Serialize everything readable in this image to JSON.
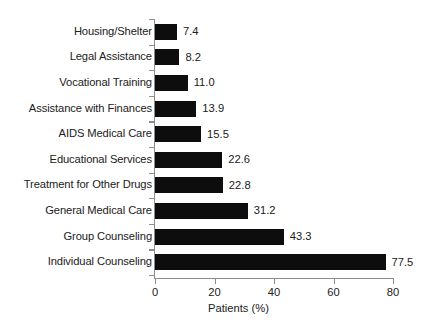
{
  "chart_data": {
    "type": "bar",
    "orientation": "horizontal",
    "title": "",
    "xlabel": "Patients (%)",
    "ylabel": "",
    "xlim": [
      0,
      80
    ],
    "xticks": [
      "0",
      "20",
      "40",
      "60",
      "80"
    ],
    "grid": false,
    "legend": null,
    "bar_color": "#0d0d0d",
    "axis_color": "#8c8c8c",
    "text_color": "#212121",
    "background": "#ffffff",
    "categories": [
      "Housing/Shelter",
      "Legal Assistance",
      "Vocational Training",
      "Assistance with Finances",
      "AIDS Medical Care",
      "Educational Services",
      "Treatment for Other Drugs",
      "General Medical Care",
      "Group Counseling",
      "Individual Counseling"
    ],
    "values": [
      7.4,
      8.2,
      11.0,
      13.9,
      15.5,
      22.6,
      22.8,
      31.2,
      43.3,
      77.5
    ],
    "value_labels": [
      "7.4",
      "8.2",
      "11.0",
      "13.9",
      "15.5",
      "22.6",
      "22.8",
      "31.2",
      "43.3",
      "77.5"
    ]
  }
}
